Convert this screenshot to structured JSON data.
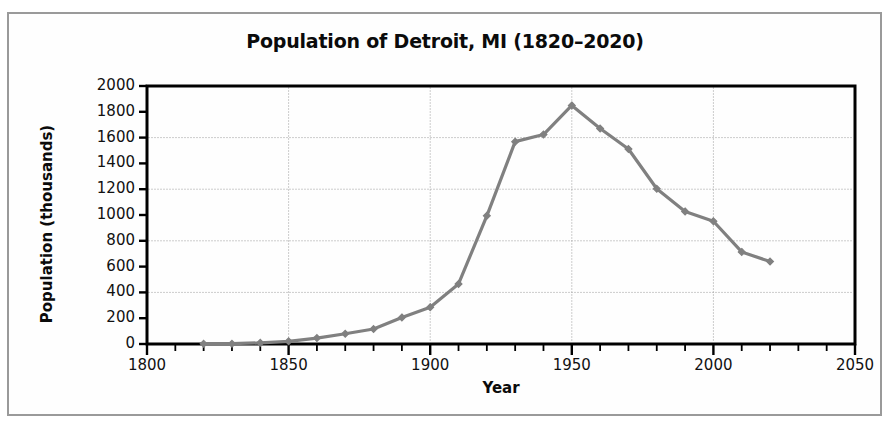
{
  "chart_data": {
    "type": "line",
    "title": "Population of Detroit, MI (1820–2020)",
    "xlabel": "Year",
    "ylabel": "Population (thousands)",
    "xlim": [
      1800,
      2050
    ],
    "ylim": [
      0,
      2000
    ],
    "grid": true,
    "legend": null,
    "series_color": "#808080",
    "marker": "diamond",
    "x": [
      1820,
      1830,
      1840,
      1850,
      1860,
      1870,
      1880,
      1890,
      1900,
      1910,
      1920,
      1930,
      1940,
      1950,
      1960,
      1970,
      1980,
      1990,
      2000,
      2010,
      2020
    ],
    "values": [
      1.4,
      2.2,
      9.1,
      21.0,
      45.6,
      79.6,
      116.3,
      205.9,
      285.7,
      465.8,
      993.7,
      1568.7,
      1623.5,
      1849.6,
      1670.1,
      1511.5,
      1203.3,
      1027.9,
      951.3,
      713.8,
      639.1
    ],
    "series": [
      {
        "name": "Population (thousands)",
        "values": [
          1.4,
          2.2,
          9.1,
          21.0,
          45.6,
          79.6,
          116.3,
          205.9,
          285.7,
          465.8,
          993.7,
          1568.7,
          1623.5,
          1849.6,
          1670.1,
          1511.5,
          1203.3,
          1027.9,
          951.3,
          713.8,
          639.1
        ]
      }
    ],
    "xticks": [
      1800,
      1850,
      1900,
      1950,
      2000,
      2050
    ],
    "xtick_labels": [
      "1800",
      "1850",
      "1900",
      "1950",
      "2000",
      "2050"
    ],
    "xminor_step": 10,
    "yticks": [
      0,
      200,
      400,
      600,
      800,
      1000,
      1200,
      1400,
      1600,
      1800,
      2000
    ],
    "ytick_labels": [
      "0",
      "200",
      "400",
      "600",
      "800",
      "1000",
      "1200",
      "1400",
      "1600",
      "1800",
      "2000"
    ]
  }
}
